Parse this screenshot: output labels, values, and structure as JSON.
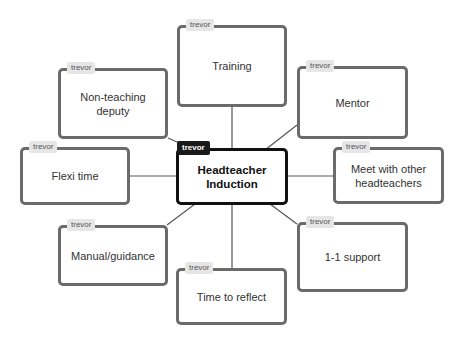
{
  "diagram": {
    "type": "mind-map",
    "colors": {
      "node_border": "#6b6b6b",
      "center_border": "#111111",
      "link": "#555555",
      "tag_bg": "#e6e6e6",
      "center_tag_bg": "#1a1a1a"
    },
    "center": {
      "author": "trevor",
      "label_line1": "Headteacher",
      "label_line2": "Induction"
    },
    "nodes": [
      {
        "id": "training",
        "author": "trevor",
        "label": "Training"
      },
      {
        "id": "non-teaching-deputy",
        "author": "trevor",
        "label": "Non-teaching deputy"
      },
      {
        "id": "mentor",
        "author": "trevor",
        "label": "Mentor"
      },
      {
        "id": "flexi-time",
        "author": "trevor",
        "label": "Flexi time"
      },
      {
        "id": "meet-with-other-headteachers",
        "author": "trevor",
        "label": "Meet with other headteachers"
      },
      {
        "id": "manual-guidance",
        "author": "trevor",
        "label": "Manual/guidance"
      },
      {
        "id": "1-1-support",
        "author": "trevor",
        "label": "1-1 support"
      },
      {
        "id": "time-to-reflect",
        "author": "trevor",
        "label": "Time to reflect"
      }
    ]
  }
}
